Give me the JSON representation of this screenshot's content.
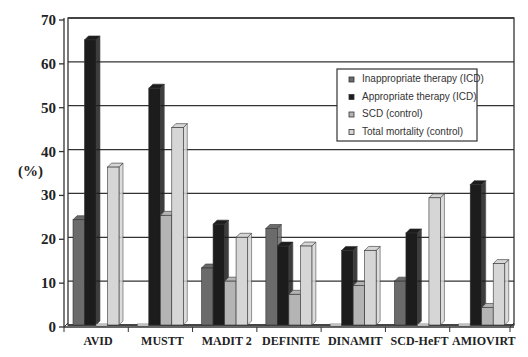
{
  "chart_data": {
    "type": "bar",
    "title": "",
    "xlabel": "",
    "ylabel": "(%)",
    "ylim": [
      0,
      70
    ],
    "yticks": [
      0,
      10,
      20,
      30,
      40,
      50,
      60,
      70
    ],
    "grid": true,
    "legend_position": "upper right (inside plot)",
    "categories": [
      "AVID",
      "MUSTT",
      "MADIT 2",
      "DEFINITE",
      "DINAMIT",
      "SCD-HeFT",
      "AMIOVIRT"
    ],
    "series": [
      {
        "name": "Inappropriate therapy (ICD)",
        "color": "#6b6b6b",
        "values": [
          24,
          0,
          13,
          22,
          0,
          10,
          0
        ]
      },
      {
        "name": "Appropriate therapy (ICD)",
        "color": "#1c1c1c",
        "values": [
          65,
          54,
          23,
          18,
          17,
          21,
          32
        ]
      },
      {
        "name": "SCD (control)",
        "color": "#b4b4b4",
        "values": [
          0,
          25,
          10,
          7,
          9,
          0,
          4
        ]
      },
      {
        "name": "Total mortality (control)",
        "color": "#d6d6d6",
        "values": [
          36,
          45,
          20,
          18,
          17,
          29,
          14
        ]
      }
    ]
  }
}
